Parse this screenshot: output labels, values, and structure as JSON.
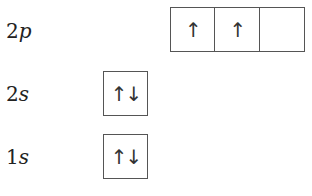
{
  "diagram": {
    "type": "orbital-box-diagram",
    "subshells": [
      {
        "label_n": "2",
        "label_l": "p",
        "orbitals": [
          "↑",
          "↑",
          ""
        ]
      },
      {
        "label_n": "2",
        "label_l": "s",
        "orbitals": [
          "↑↓"
        ]
      },
      {
        "label_n": "1",
        "label_l": "s",
        "orbitals": [
          "↑↓"
        ]
      }
    ]
  }
}
